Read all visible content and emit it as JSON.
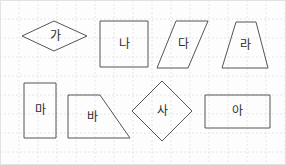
{
  "worksheet": {
    "title": "도형 학습지",
    "background_color": "#fdfdfd",
    "grid": {
      "color": "#e6e6ea",
      "spacing": 19,
      "style": "dotted",
      "visible": true
    },
    "stroke_color": "#555555",
    "label_color": "#2b2b2b"
  },
  "shapes": [
    {
      "id": "shape-ga",
      "label": "가",
      "type": "rhombus",
      "points": "22,36 54,21 87,36 54,51",
      "label_x": 55,
      "label_y": 36
    },
    {
      "id": "shape-na",
      "label": "나",
      "type": "square",
      "points": "100,21 148,21 148,67 100,67",
      "label_x": 124,
      "label_y": 44
    },
    {
      "id": "shape-da",
      "label": "다",
      "type": "parallelogram",
      "points": "176,21 208,21 188,68 157,68",
      "label_x": 183,
      "label_y": 44
    },
    {
      "id": "shape-ra",
      "label": "라",
      "type": "trapezoid",
      "points": "236,22 256,22 268,68 222,68",
      "label_x": 245,
      "label_y": 45
    },
    {
      "id": "shape-ma",
      "label": "마",
      "type": "rectangle",
      "points": "24,83 56,83 56,138 24,138",
      "label_x": 40,
      "label_y": 110
    },
    {
      "id": "shape-ba",
      "label": "바",
      "type": "right-trapezoid",
      "points": "68,95 100,95 130,138 68,138",
      "label_x": 92,
      "label_y": 117
    },
    {
      "id": "shape-sa",
      "label": "사",
      "type": "diamond",
      "points": "162,81 192,111 162,141 132,111",
      "label_x": 162,
      "label_y": 111
    },
    {
      "id": "shape-a",
      "label": "아",
      "type": "rectangle",
      "points": "205,95 270,95 270,128 205,128",
      "label_x": 237,
      "label_y": 111
    }
  ]
}
